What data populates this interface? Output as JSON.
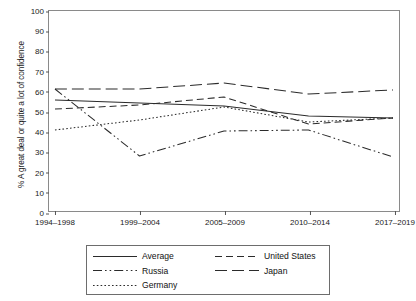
{
  "chart_data": {
    "type": "line",
    "title": "",
    "xlabel": "",
    "ylabel": "% A great deal or quite a lot of confidence",
    "categories": [
      "1994–1998",
      "1999–2004",
      "2005–2009",
      "2010–2014",
      "2017–2019"
    ],
    "ylim": [
      0,
      100
    ],
    "yticks": [
      0,
      10,
      20,
      30,
      40,
      50,
      60,
      70,
      80,
      90,
      100
    ],
    "grid": false,
    "legend_position": "bottom",
    "series": [
      {
        "name": "Average",
        "style": "solid",
        "values": [
          55.5,
          54.0,
          52.5,
          47.5,
          46.5
        ]
      },
      {
        "name": "United States",
        "style": "dashed",
        "values": [
          51.0,
          53.0,
          57.0,
          43.5,
          46.5
        ]
      },
      {
        "name": "Russia",
        "style": "dash-dot-dot",
        "values": [
          61.0,
          27.5,
          40.0,
          40.5,
          27.0
        ]
      },
      {
        "name": "Japan",
        "style": "long-dash",
        "values": [
          61.0,
          61.0,
          64.0,
          58.5,
          60.5
        ]
      },
      {
        "name": "Germany",
        "style": "dotted",
        "values": [
          40.5,
          45.5,
          52.0,
          44.5,
          46.5
        ]
      }
    ]
  },
  "legend": {
    "items": [
      {
        "label": "Average",
        "swatch": "solid-line-swatch"
      },
      {
        "label": "United States",
        "swatch": "dashed-line-swatch"
      },
      {
        "label": "Russia",
        "swatch": "dash-dot-dot-line-swatch"
      },
      {
        "label": "Japan",
        "swatch": "long-dash-line-swatch"
      },
      {
        "label": "Germany",
        "swatch": "dotted-line-swatch"
      }
    ]
  },
  "colors": {
    "line": "#2b2b2b",
    "axis": "#8a8a8a",
    "text": "#1a1a1a",
    "background": "#ffffff"
  }
}
